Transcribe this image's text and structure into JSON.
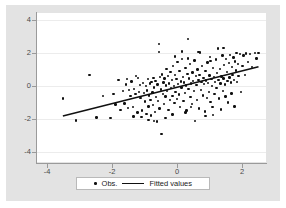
{
  "chart_data": {
    "type": "scatter",
    "title": "",
    "xlabel": "",
    "ylabel": "",
    "xlim": [
      -4.35,
      2.75
    ],
    "ylim": [
      -4.6,
      4.45
    ],
    "xticks": [
      -4,
      -2,
      0,
      2
    ],
    "xtick_labels": [
      "-4",
      "-2",
      "0",
      "2"
    ],
    "yticks": [
      4,
      2,
      0,
      -2,
      -4
    ],
    "ytick_labels": [
      "4",
      "2",
      "0",
      "-2",
      "-4"
    ],
    "grid": "horizontal",
    "legend_position": "bottom-center",
    "marker_color": "#101010",
    "line_color": "#101010",
    "plot_background": "#ffffff",
    "figure_background": "#e3e3e3",
    "series": [
      {
        "name": "Obs.",
        "type": "scatter",
        "points": [
          [
            -3.52,
            -0.74
          ],
          [
            -3.12,
            -2.08
          ],
          [
            -2.7,
            0.68
          ],
          [
            -2.28,
            -0.58
          ],
          [
            -2.05,
            -1.92
          ],
          [
            -1.9,
            -1.1
          ],
          [
            -1.8,
            0.4
          ],
          [
            -1.74,
            -1.44
          ],
          [
            -1.66,
            -0.3
          ],
          [
            -1.62,
            -1.05
          ],
          [
            -1.58,
            0.12
          ],
          [
            -1.52,
            -1.32
          ],
          [
            -1.48,
            -0.22
          ],
          [
            -1.44,
            -0.6
          ],
          [
            -1.4,
            0.3
          ],
          [
            -1.36,
            -1.26
          ],
          [
            -1.32,
            -0.15
          ],
          [
            -1.28,
            -0.48
          ],
          [
            -1.26,
            0.62
          ],
          [
            -1.22,
            -1.58
          ],
          [
            -1.18,
            -0.35
          ],
          [
            -1.15,
            0.08
          ],
          [
            -1.12,
            -0.7
          ],
          [
            -1.08,
            -1.48
          ],
          [
            -1.05,
            0.2
          ],
          [
            -1.02,
            -0.42
          ],
          [
            -0.99,
            -0.92
          ],
          [
            -0.96,
            0.02
          ],
          [
            -0.94,
            -1.68
          ],
          [
            -0.92,
            -0.26
          ],
          [
            -0.9,
            0.44
          ],
          [
            -0.88,
            -1.22
          ],
          [
            -0.86,
            -0.55
          ],
          [
            -0.84,
            0.18
          ],
          [
            -0.82,
            -0.82
          ],
          [
            -0.8,
            -1.78
          ],
          [
            -0.78,
            0.26
          ],
          [
            -0.76,
            -0.38
          ],
          [
            -0.74,
            -1.12
          ],
          [
            -0.72,
            0.52
          ],
          [
            -0.7,
            -0.08
          ],
          [
            -0.68,
            -1.55
          ],
          [
            -0.66,
            0.34
          ],
          [
            -0.64,
            -0.66
          ],
          [
            -0.62,
            -2.14
          ],
          [
            -0.6,
            0.1
          ],
          [
            -0.58,
            -0.9
          ],
          [
            -0.56,
            2.08
          ],
          [
            -0.55,
            2.58
          ],
          [
            -0.54,
            -1.35
          ],
          [
            -0.52,
            0.56
          ],
          [
            -0.5,
            -0.2
          ],
          [
            -0.48,
            -2.88
          ],
          [
            -0.46,
            0.72
          ],
          [
            -0.44,
            -0.46
          ],
          [
            -0.42,
            0.22
          ],
          [
            -0.4,
            -1.06
          ],
          [
            -0.38,
            0.48
          ],
          [
            -0.36,
            -0.62
          ],
          [
            -0.34,
            0.04
          ],
          [
            -0.32,
            1.06
          ],
          [
            -0.3,
            -0.3
          ],
          [
            -0.28,
            0.64
          ],
          [
            -0.26,
            -1.44
          ],
          [
            -0.24,
            0.16
          ],
          [
            -0.22,
            -0.84
          ],
          [
            -0.2,
            0.88
          ],
          [
            -0.18,
            -0.12
          ],
          [
            -0.16,
            0.38
          ],
          [
            -0.14,
            -0.58
          ],
          [
            -0.12,
            1.24
          ],
          [
            -0.1,
            0.02
          ],
          [
            -0.08,
            -1.02
          ],
          [
            -0.06,
            0.7
          ],
          [
            -0.04,
            -0.34
          ],
          [
            -0.02,
            0.44
          ],
          [
            0.0,
            -0.76
          ],
          [
            0.02,
            1.48
          ],
          [
            0.04,
            0.14
          ],
          [
            0.06,
            -0.5
          ],
          [
            0.08,
            0.92
          ],
          [
            0.1,
            -1.24
          ],
          [
            0.12,
            0.3
          ],
          [
            0.14,
            -0.06
          ],
          [
            0.16,
            1.66
          ],
          [
            0.18,
            0.58
          ],
          [
            0.2,
            -0.88
          ],
          [
            0.22,
            0.24
          ],
          [
            0.24,
            -0.4
          ],
          [
            0.26,
            1.1
          ],
          [
            0.28,
            0.06
          ],
          [
            0.3,
            -1.46
          ],
          [
            0.32,
            0.76
          ],
          [
            0.34,
            2.86
          ],
          [
            0.36,
            -0.18
          ],
          [
            0.38,
            0.48
          ],
          [
            0.4,
            1.34
          ],
          [
            0.42,
            -0.66
          ],
          [
            0.44,
            0.18
          ],
          [
            0.46,
            -1.08
          ],
          [
            0.48,
            0.84
          ],
          [
            0.5,
            0.34
          ],
          [
            0.52,
            -0.28
          ],
          [
            0.54,
            1.56
          ],
          [
            0.56,
            -2.12
          ],
          [
            0.58,
            0.62
          ],
          [
            0.6,
            0.08
          ],
          [
            0.62,
            -0.84
          ],
          [
            0.64,
            1.02
          ],
          [
            0.66,
            0.4
          ],
          [
            0.68,
            -1.34
          ],
          [
            0.7,
            0.7
          ],
          [
            0.72,
            2.06
          ],
          [
            0.74,
            -0.22
          ],
          [
            0.76,
            0.26
          ],
          [
            0.78,
            1.22
          ],
          [
            0.8,
            -0.56
          ],
          [
            0.82,
            0.52
          ],
          [
            0.84,
            0.14
          ],
          [
            0.86,
            -1.52
          ],
          [
            0.88,
            0.94
          ],
          [
            0.9,
            0.36
          ],
          [
            0.92,
            -0.7
          ],
          [
            0.94,
            1.44
          ],
          [
            0.96,
            0.2
          ],
          [
            0.98,
            -0.34
          ],
          [
            1.0,
            0.66
          ],
          [
            1.02,
            1.78
          ],
          [
            1.04,
            -0.94
          ],
          [
            1.06,
            0.44
          ],
          [
            1.08,
            0.02
          ],
          [
            1.1,
            -1.24
          ],
          [
            1.12,
            1.12
          ],
          [
            1.14,
            0.56
          ],
          [
            1.16,
            -0.46
          ],
          [
            1.18,
            0.28
          ],
          [
            1.2,
            1.62
          ],
          [
            1.22,
            -0.12
          ],
          [
            1.24,
            0.8
          ],
          [
            1.26,
            2.3
          ],
          [
            1.28,
            0.38
          ],
          [
            1.3,
            -0.74
          ],
          [
            1.32,
            1.04
          ],
          [
            1.34,
            0.16
          ],
          [
            1.36,
            -1.42
          ],
          [
            1.38,
            0.6
          ],
          [
            1.4,
            1.86
          ],
          [
            1.42,
            -0.3
          ],
          [
            1.44,
            0.48
          ],
          [
            1.46,
            1.28
          ],
          [
            1.48,
            0.1
          ],
          [
            1.5,
            -0.62
          ],
          [
            1.52,
            1.66
          ],
          [
            1.54,
            0.86
          ],
          [
            1.56,
            0.32
          ],
          [
            1.58,
            -0.98
          ],
          [
            1.6,
            1.4
          ],
          [
            1.62,
            0.54
          ],
          [
            1.64,
            1.92
          ],
          [
            1.66,
            0.22
          ],
          [
            1.68,
            -0.44
          ],
          [
            1.7,
            1.16
          ],
          [
            1.72,
            0.68
          ],
          [
            1.74,
            1.74
          ],
          [
            1.76,
            0.4
          ],
          [
            1.78,
            -1.22
          ],
          [
            1.8,
            1.5
          ],
          [
            1.82,
            0.96
          ],
          [
            1.84,
            2.04
          ],
          [
            1.86,
            0.26
          ],
          [
            1.88,
            1.34
          ],
          [
            1.9,
            0.62
          ],
          [
            1.94,
            1.98
          ],
          [
            1.98,
            -0.34
          ],
          [
            2.02,
            1.24
          ],
          [
            2.06,
            1.88
          ],
          [
            2.1,
            0.7
          ],
          [
            2.14,
            2.0
          ],
          [
            2.2,
            1.46
          ],
          [
            2.26,
            1.96
          ],
          [
            2.32,
            1.18
          ],
          [
            2.4,
            2.02
          ],
          [
            2.46,
            1.7
          ],
          [
            2.52,
            2.04
          ],
          [
            -1.34,
            -1.84
          ],
          [
            -1.1,
            -1.88
          ],
          [
            -0.88,
            -2.04
          ],
          [
            -0.7,
            -2.1
          ],
          [
            -2.48,
            -1.9
          ],
          [
            -1.96,
            -0.48
          ],
          [
            -0.36,
            -1.92
          ],
          [
            0.26,
            -1.58
          ],
          [
            0.88,
            -1.8
          ],
          [
            1.12,
            -1.74
          ],
          [
            -0.14,
            -1.7
          ],
          [
            0.44,
            -1.26
          ],
          [
            -1.54,
            0.44
          ],
          [
            -1.2,
            0.5
          ],
          [
            0.16,
            2.12
          ],
          [
            0.66,
            2.1
          ],
          [
            1.04,
            1.52
          ],
          [
            1.44,
            2.34
          ],
          [
            -0.06,
            1.8
          ],
          [
            0.34,
            1.7
          ]
        ]
      },
      {
        "name": "Fitted values",
        "type": "line",
        "slope": 0.497,
        "intercept": -0.06,
        "endpoints": [
          [
            -3.52,
            -1.81
          ],
          [
            2.52,
            1.19
          ]
        ]
      }
    ]
  },
  "legend": {
    "obs_label": "Obs.",
    "fitted_label": "Fitted values"
  }
}
